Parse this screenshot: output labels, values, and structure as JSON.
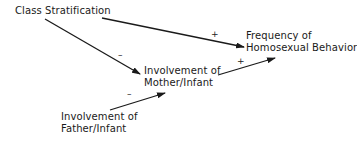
{
  "diagram": {
    "nodes": [
      {
        "id": "class",
        "lines": [
          "Class Stratification"
        ]
      },
      {
        "id": "freq",
        "lines": [
          "Frequency of",
          "Homosexual Behavior"
        ]
      },
      {
        "id": "mother",
        "lines": [
          "Involvement of",
          "Mother/Infant"
        ]
      },
      {
        "id": "father",
        "lines": [
          "Involvement of",
          "Father/Infant"
        ]
      }
    ],
    "edges": [
      {
        "from": "class",
        "to": "freq",
        "sign": "+"
      },
      {
        "from": "class",
        "to": "mother",
        "sign": "–"
      },
      {
        "from": "mother",
        "to": "freq",
        "sign": "+"
      },
      {
        "from": "father",
        "to": "mother",
        "sign": "–"
      }
    ]
  }
}
